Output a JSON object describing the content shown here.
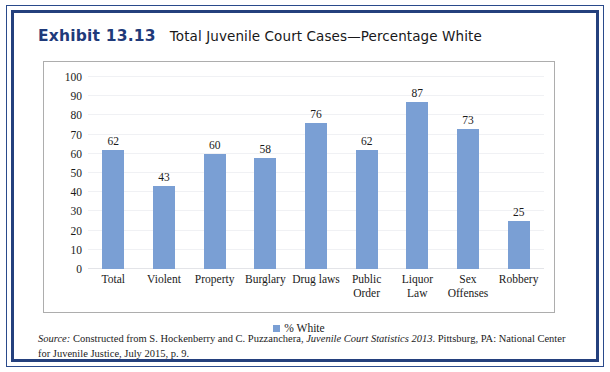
{
  "exhibit": {
    "label": "Exhibit 13.13",
    "title": "Total Juvenile Court Cases—Percentage White"
  },
  "source_note": {
    "prefix": "Source:",
    "text_before_italic": " Constructed from S. Hockenberry and C. Puzzanchera, ",
    "italic_title": "Juvenile Court Statistics 2013",
    "text_after_italic": ". Pittsburg, PA: National Center for Juvenile Justice, July 2015, p. 9."
  },
  "colors": {
    "bar": "#7a9fd4",
    "border_navy": "#24407d",
    "exhibit_label": "#1f3a7a",
    "plot_border": "#adadad",
    "gridline": "#f0f1f4"
  },
  "chart_data": {
    "type": "bar",
    "title": "Total Juvenile Court Cases—Percentage White",
    "xlabel": "",
    "ylabel": "",
    "ylim": [
      0,
      100
    ],
    "yticks": [
      0,
      10,
      20,
      30,
      40,
      50,
      60,
      70,
      80,
      90,
      100
    ],
    "grid": true,
    "legend_position": "bottom",
    "categories": [
      "Total",
      "Violent",
      "Property",
      "Burglary",
      "Drug laws",
      "Public Order",
      "Liquor Law",
      "Sex Offenses",
      "Robbery"
    ],
    "category_lines": [
      [
        "Total"
      ],
      [
        "Violent"
      ],
      [
        "Property"
      ],
      [
        "Burglary"
      ],
      [
        "Drug laws"
      ],
      [
        "Public",
        "Order"
      ],
      [
        "Liquor Law"
      ],
      [
        "Sex",
        "Offenses"
      ],
      [
        "Robbery"
      ]
    ],
    "series": [
      {
        "name": "% White",
        "values": [
          62,
          43,
          60,
          58,
          76,
          62,
          87,
          73,
          25
        ]
      }
    ]
  }
}
